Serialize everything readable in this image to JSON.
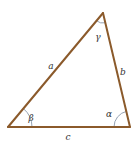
{
  "diagram": {
    "type": "triangle",
    "colors": {
      "side": "#8b5a2b",
      "arc": "#7a8aa0",
      "text": "#333333",
      "background": "#ffffff"
    },
    "vertices": {
      "top": {
        "x": 103,
        "y": 13
      },
      "bottom_left": {
        "x": 8,
        "y": 127
      },
      "bottom_right": {
        "x": 130,
        "y": 127
      }
    },
    "sides": [
      {
        "name": "a",
        "label": "a",
        "from": "bottom_left",
        "to": "top"
      },
      {
        "name": "b",
        "label": "b",
        "from": "top",
        "to": "bottom_right"
      },
      {
        "name": "c",
        "label": "c",
        "from": "bottom_left",
        "to": "bottom_right"
      }
    ],
    "angles": [
      {
        "name": "gamma",
        "label": "γ",
        "vertex": "top"
      },
      {
        "name": "beta",
        "label": "β",
        "vertex": "bottom_left"
      },
      {
        "name": "alpha",
        "label": "α",
        "vertex": "bottom_right"
      }
    ],
    "labels": {
      "side_a": "a",
      "side_b": "b",
      "side_c": "c",
      "angle_gamma": "γ",
      "angle_beta": "β",
      "angle_alpha": "α"
    }
  }
}
